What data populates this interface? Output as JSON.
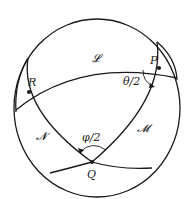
{
  "diagram": {
    "colors": {
      "stroke": "#1a1a1a",
      "background": "#ffffff"
    },
    "points": [
      {
        "id": "P",
        "label": "P",
        "x": 159,
        "y": 68
      },
      {
        "id": "R",
        "label": "R",
        "x": 29,
        "y": 92
      },
      {
        "id": "Q",
        "label": "Q",
        "x": 92,
        "y": 162
      }
    ],
    "curves": [
      {
        "id": "L",
        "label": "𝓛"
      },
      {
        "id": "M",
        "label": "𝓜"
      },
      {
        "id": "N",
        "label": "𝓝"
      }
    ],
    "angles": [
      {
        "id": "theta",
        "label": "θ/2",
        "at": "P"
      },
      {
        "id": "phi",
        "label": "φ/2",
        "at": "Q"
      }
    ]
  }
}
